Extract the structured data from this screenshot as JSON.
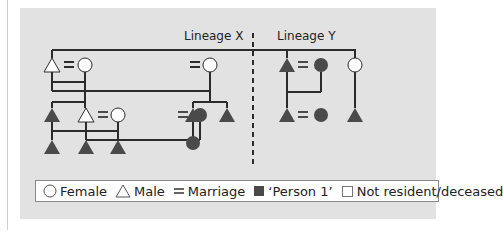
{
  "diagram": {
    "lineages": [
      {
        "label": "Lineage X"
      },
      {
        "label": "Lineage Y"
      }
    ],
    "colors": {
      "panel_bg": "#e2e2e2",
      "line": "#2b2b2b",
      "filled": "#4a4a4a",
      "open": "#ffffff"
    }
  },
  "legend": {
    "items": [
      {
        "symbol": "circle-open",
        "label": "Female"
      },
      {
        "symbol": "triangle-open",
        "label": "Male"
      },
      {
        "symbol": "equals",
        "label": "Marriage"
      },
      {
        "symbol": "square-filled",
        "label": "‘Person 1’"
      },
      {
        "symbol": "square-open",
        "label": "Not resident/deceased"
      }
    ]
  }
}
